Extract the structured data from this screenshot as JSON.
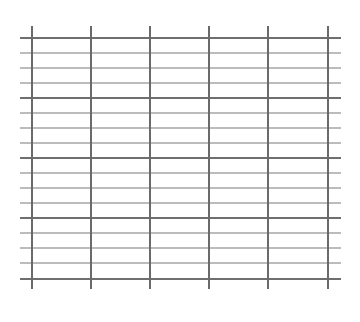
{
  "grid": {
    "background": "#ffffff",
    "major_color": "#6f6f6f",
    "minor_color": "#a6a6a6",
    "vertical_color": "#6a6a6a",
    "h_line_x_start": 20,
    "h_line_x_end": 341,
    "v_line_y_start": 26,
    "v_line_y_end": 289,
    "vertical_lines_x": [
      32,
      91,
      150,
      209,
      268,
      328
    ],
    "horizontal_lines": [
      {
        "y": 38,
        "type": "major"
      },
      {
        "y": 53,
        "type": "minor"
      },
      {
        "y": 68,
        "type": "minor"
      },
      {
        "y": 83,
        "type": "minor"
      },
      {
        "y": 98,
        "type": "major"
      },
      {
        "y": 113,
        "type": "minor"
      },
      {
        "y": 128,
        "type": "minor"
      },
      {
        "y": 143,
        "type": "minor"
      },
      {
        "y": 158,
        "type": "major"
      },
      {
        "y": 173,
        "type": "minor"
      },
      {
        "y": 188,
        "type": "minor"
      },
      {
        "y": 203,
        "type": "minor"
      },
      {
        "y": 218,
        "type": "major"
      },
      {
        "y": 233,
        "type": "minor"
      },
      {
        "y": 248,
        "type": "minor"
      },
      {
        "y": 263,
        "type": "minor"
      },
      {
        "y": 279,
        "type": "major"
      }
    ],
    "major_width": 2.2,
    "minor_width": 1.4,
    "vertical_width": 2
  }
}
